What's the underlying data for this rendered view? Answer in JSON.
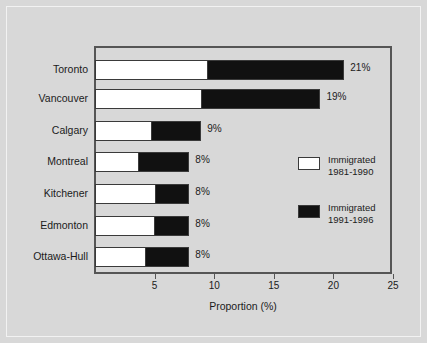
{
  "chart_data": {
    "type": "bar",
    "orientation": "horizontal",
    "stacked": true,
    "title": "",
    "xlabel": "Proportion (%)",
    "ylabel": "",
    "xlim": [
      0,
      25
    ],
    "xticks": [
      5,
      10,
      15,
      20,
      25
    ],
    "xtick_labels": [
      "5",
      "10",
      "15",
      "20",
      "25"
    ],
    "grid": false,
    "legend_position": "right-middle",
    "categories": [
      "Toronto",
      "Vancouver",
      "Calgary",
      "Montreal",
      "Kitchener",
      "Edmonton",
      "Ottawa-Hull"
    ],
    "series": [
      {
        "name": "Immigrated 1981-1990",
        "color": "#ffffff",
        "values": [
          9.5,
          9.0,
          4.8,
          3.7,
          5.1,
          5.0,
          4.3
        ]
      },
      {
        "name": "Immigrated 1991-1996",
        "color": "#111111",
        "values": [
          11.5,
          10.0,
          4.2,
          4.3,
          2.9,
          3.0,
          3.7
        ]
      }
    ],
    "totals": [
      21,
      19,
      9,
      8,
      8,
      8,
      8
    ],
    "data_labels": [
      "21%",
      "19%",
      "9%",
      "8%",
      "8%",
      "8%",
      "8%"
    ]
  },
  "legend": {
    "entries": [
      {
        "line1": "Immigrated",
        "line2": "1981-1990",
        "swatch": "white"
      },
      {
        "line1": "Immigrated",
        "line2": "1991-1996",
        "swatch": "black"
      }
    ]
  },
  "axis": {
    "x_title": "Proportion (%)"
  }
}
